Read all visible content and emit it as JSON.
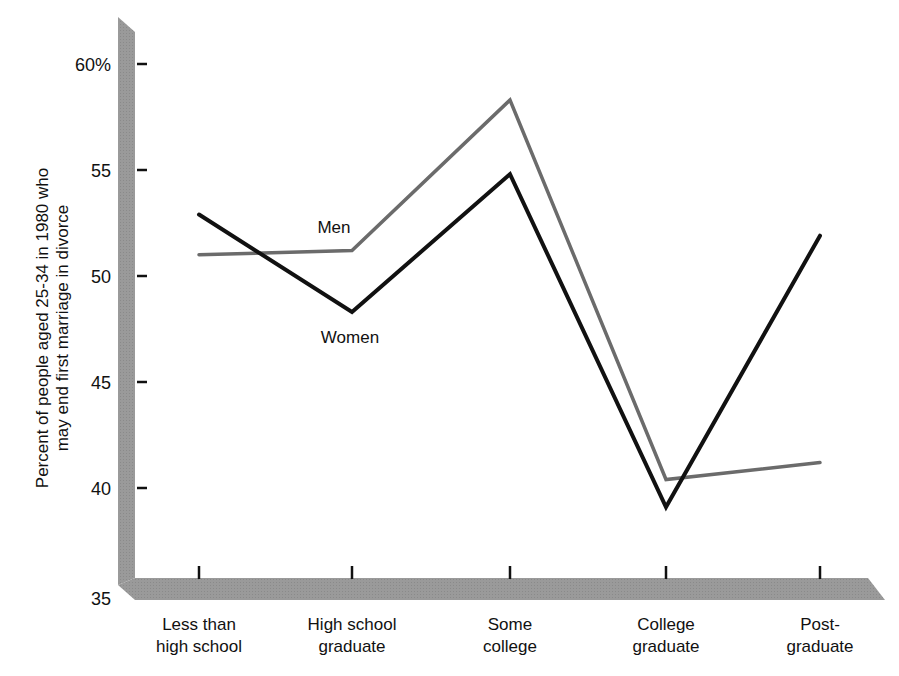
{
  "chart_data": {
    "type": "line",
    "title": "",
    "ylabel": "Percent of people aged 25-34 in 1980 who may end first marriage in divorce",
    "ylabel_lines": [
      "Percent of people aged 25-34 in 1980 who",
      "may end first marriage in divorce"
    ],
    "xlabel": "",
    "ylim": [
      35,
      60
    ],
    "yticks": [
      35,
      40,
      45,
      50,
      55,
      60
    ],
    "ytick_labels": [
      "35",
      "40",
      "45",
      "50",
      "55",
      "60%"
    ],
    "categories": [
      "Less than high school",
      "High school graduate",
      "Some college",
      "College graduate",
      "Post-graduate"
    ],
    "category_lines": [
      [
        "Less than",
        "high school"
      ],
      [
        "High school",
        "graduate"
      ],
      [
        "Some",
        "college"
      ],
      [
        "College",
        "graduate"
      ],
      [
        "Post-",
        "graduate"
      ]
    ],
    "series": [
      {
        "name": "Men",
        "color": "#6b6b6b",
        "values": [
          51.0,
          51.2,
          58.3,
          40.4,
          41.2
        ]
      },
      {
        "name": "Women",
        "color": "#111111",
        "values": [
          52.9,
          48.3,
          54.8,
          39.1,
          51.9
        ]
      }
    ],
    "grid": false,
    "legend": "inline labels"
  },
  "colors": {
    "axis_bar": "#999999",
    "men_line": "#6b6b6b",
    "women_line": "#111111"
  }
}
